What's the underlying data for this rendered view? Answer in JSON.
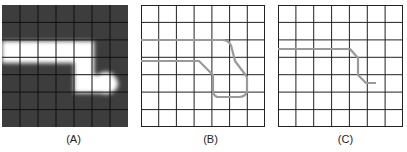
{
  "panels": [
    {
      "id": "A",
      "label": "(A)",
      "type": "heatmap",
      "rows": 7,
      "cols": 7,
      "background_color": "#3d3d3d",
      "highlight_color": "#ffffff",
      "grid_color": "#111111"
    },
    {
      "id": "B",
      "label": "(B)",
      "type": "path-outline",
      "rows": 7,
      "cols": 7,
      "path_color": "#999999",
      "grid_color": "#222222"
    },
    {
      "id": "C",
      "label": "(C)",
      "type": "path-centerline",
      "rows": 7,
      "cols": 7,
      "path_color": "#999999",
      "grid_color": "#222222"
    }
  ]
}
